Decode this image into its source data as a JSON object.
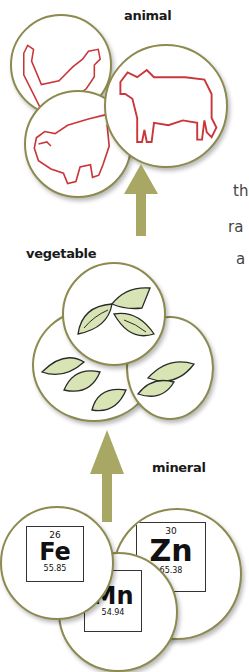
{
  "colors": {
    "arrow": "#a9a764",
    "circle_border": "#8c8a4e",
    "animal_outline": "#c8373a",
    "leaf_fill": "#d8e4b4",
    "leaf_outline": "#2a2a2a"
  },
  "tiers": {
    "animal": {
      "label": "animal",
      "icons": [
        "rooster-icon",
        "cow-icon",
        "pig-icon"
      ]
    },
    "vegetable": {
      "label": "vegetable",
      "icons": [
        "leaves-icon",
        "leaves-icon",
        "leaves-icon"
      ]
    },
    "mineral": {
      "label": "mineral",
      "elements": [
        {
          "number": "26",
          "symbol": "Fe",
          "mass": "55.85"
        },
        {
          "number": "30",
          "symbol": "Zn",
          "mass": "65.38"
        },
        {
          "number": "25",
          "symbol": "Mn",
          "mass": "54.94"
        }
      ],
      "zn_mass_visible": ".38"
    }
  },
  "text_fragments": [
    "th",
    "ra",
    "a"
  ]
}
